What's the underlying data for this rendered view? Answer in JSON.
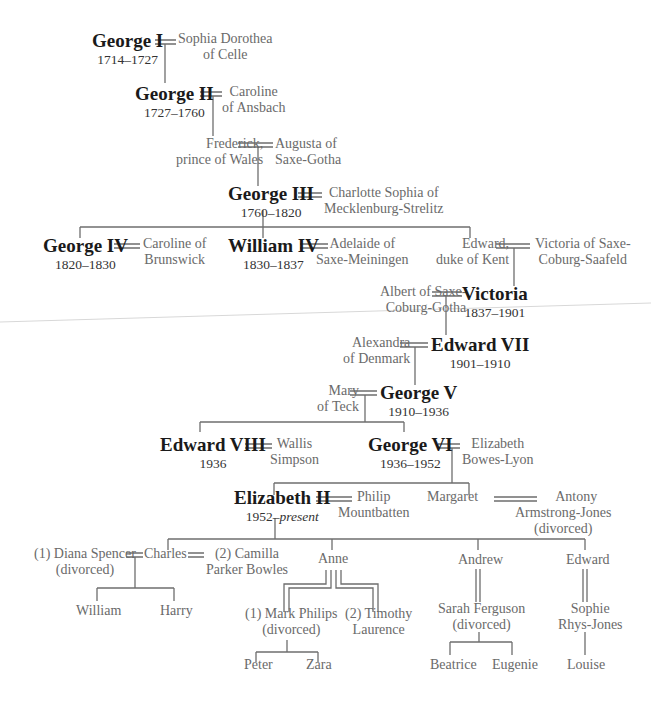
{
  "diagram": {
    "type": "family-tree",
    "colors": {
      "monarch_text": "#1a1a1a",
      "spouse_text": "#6a6a6a",
      "line": "#6e6e6e",
      "background": "#ffffff"
    },
    "nodes": {
      "george1": {
        "name": "George I",
        "reign": "1714–1727"
      },
      "sophia": {
        "line1": "Sophia Dorothea",
        "line2": "of Celle"
      },
      "george2": {
        "name": "George II",
        "reign": "1727–1760"
      },
      "caroline_ansbach": {
        "line1": "Caroline",
        "line2": "of Ansbach"
      },
      "frederick": {
        "line1": "Frederick,",
        "line2": "prince of Wales"
      },
      "augusta": {
        "line1": "Augusta of",
        "line2": "Saxe-Gotha"
      },
      "george3": {
        "name": "George III",
        "reign": "1760–1820"
      },
      "charlotte": {
        "line1": "Charlotte Sophia of",
        "line2": "Mecklenburg-Strelitz"
      },
      "george4": {
        "name": "George IV",
        "reign": "1820–1830"
      },
      "caroline_brunswick": {
        "line1": "Caroline of",
        "line2": "Brunswick"
      },
      "william4": {
        "name": "William IV",
        "reign": "1830–1837"
      },
      "adelaide": {
        "line1": "Adelaide of",
        "line2": "Saxe-Meiningen"
      },
      "edward_kent": {
        "line1": "Edward,",
        "line2": "duke of Kent"
      },
      "victoria_saxe": {
        "line1": "Victoria of Saxe-",
        "line2": "Coburg-Saafeld"
      },
      "albert": {
        "line1": "Albert of Saxe-",
        "line2": "Coburg-Gotha"
      },
      "victoria": {
        "name": "Victoria",
        "reign": "1837–1901"
      },
      "alexandra": {
        "line1": "Alexandra",
        "line2": "of Denmark"
      },
      "edward7": {
        "name": "Edward VII",
        "reign": "1901–1910"
      },
      "mary_teck": {
        "line1": "Mary",
        "line2": "of Teck"
      },
      "george5": {
        "name": "George V",
        "reign": "1910–1936"
      },
      "edward8": {
        "name": "Edward VIII",
        "reign": "1936"
      },
      "wallis": {
        "line1": "Wallis",
        "line2": "Simpson"
      },
      "george6": {
        "name": "George VI",
        "reign": "1936–1952"
      },
      "elizabeth_bl": {
        "line1": "Elizabeth",
        "line2": "Bowes-Lyon"
      },
      "elizabeth2": {
        "name": "Elizabeth II",
        "reign_start": "1952–",
        "reign_end": "present"
      },
      "philip": {
        "line1": "Philip",
        "line2": "Mountbatten"
      },
      "margaret": {
        "line1": "Margaret"
      },
      "antony": {
        "line1": "Antony",
        "line2": "Armstrong-Jones",
        "line3": "(divorced)"
      },
      "diana": {
        "line1": "(1) Diana Spencer",
        "line2": "(divorced)"
      },
      "charles": {
        "line1": "Charles"
      },
      "camilla": {
        "line1": "(2) Camilla",
        "line2": "Parker Bowles"
      },
      "william": {
        "line1": "William"
      },
      "harry": {
        "line1": "Harry"
      },
      "anne": {
        "line1": "Anne"
      },
      "mark": {
        "line1": "(1) Mark Philips",
        "line2": "(divorced)"
      },
      "timothy": {
        "line1": "(2) Timothy",
        "line2": "Laurence"
      },
      "peter": {
        "line1": "Peter"
      },
      "zara": {
        "line1": "Zara"
      },
      "andrew": {
        "line1": "Andrew"
      },
      "sarah": {
        "line1": "Sarah Ferguson",
        "line2": "(divorced)"
      },
      "beatrice": {
        "line1": "Beatrice"
      },
      "eugenie": {
        "line1": "Eugenie"
      },
      "edward_w": {
        "line1": "Edward"
      },
      "sophie": {
        "line1": "Sophie",
        "line2": "Rhys-Jones"
      },
      "louise": {
        "line1": "Louise"
      }
    }
  }
}
